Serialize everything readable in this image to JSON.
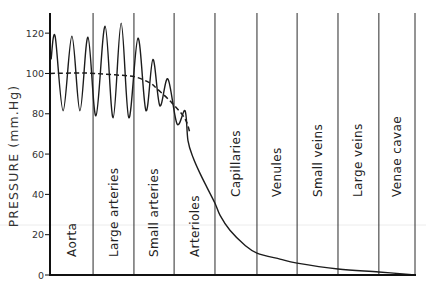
{
  "chart_data": {
    "type": "line",
    "title": "",
    "xlabel": "",
    "ylabel": "PRESSURE (mm.Hg)",
    "xlim": [
      0,
      100
    ],
    "ylim": [
      0,
      130
    ],
    "yticks": [
      0,
      20,
      40,
      60,
      80,
      100,
      120
    ],
    "ytick_labels": [
      "0",
      "20",
      "40",
      "60",
      "80",
      "100",
      "120"
    ],
    "grid": false,
    "legend": null,
    "regions": [
      {
        "label": "Aorta",
        "start": 0,
        "end": 11.8
      },
      {
        "label": "Large arteries",
        "start": 11.8,
        "end": 23.0
      },
      {
        "label": "Small arteries",
        "start": 23.0,
        "end": 34.0
      },
      {
        "label": "Arterioles",
        "start": 34.0,
        "end": 45.2
      },
      {
        "label": "Capillaries",
        "start": 45.2,
        "end": 56.7
      },
      {
        "label": "Venules",
        "start": 56.7,
        "end": 67.7
      },
      {
        "label": "Small veins",
        "start": 67.7,
        "end": 78.9
      },
      {
        "label": "Large veins",
        "start": 78.9,
        "end": 90.1
      },
      {
        "label": "Venae cavae",
        "start": 90.1,
        "end": 100
      }
    ],
    "series": [
      {
        "name": "pulsatile pressure",
        "style": "solid",
        "x": [
          0.3,
          1.4,
          3.6,
          6.0,
          8.2,
          10.4,
          12.6,
          15.1,
          17.3,
          19.5,
          21.6,
          24.1,
          26.3,
          28.2,
          30.1,
          32.3,
          34.8,
          37.0,
          37.8,
          39.2,
          41.1,
          43.0,
          45.2,
          46.6,
          49.3,
          53.4,
          56.7,
          63.0,
          67.7,
          78.9,
          90.1,
          100
        ],
        "y": [
          107,
          118.5,
          81.5,
          118.5,
          81.5,
          118,
          79,
          123.5,
          78,
          125,
          78,
          117.5,
          81.5,
          107,
          84,
          97.3,
          75,
          81.5,
          66.7,
          58.3,
          50.4,
          43.5,
          35.6,
          29.6,
          22.2,
          14.8,
          10.9,
          7.9,
          5.9,
          3,
          1.5,
          0
        ]
      },
      {
        "name": "mean pressure",
        "style": "dashed",
        "x": [
          0,
          9.6,
          17.8,
          23.3,
          27.4,
          28.8,
          33.4,
          37.0,
          38.4
        ],
        "y": [
          100,
          100.2,
          99.3,
          98.3,
          95.3,
          93.3,
          85.4,
          77.5,
          70
        ]
      }
    ],
    "colors": {
      "background": "#ffffff",
      "line": "#1c1c1c",
      "axis": "#111111",
      "divider": "#2a2a2a",
      "text": "#333333"
    }
  }
}
